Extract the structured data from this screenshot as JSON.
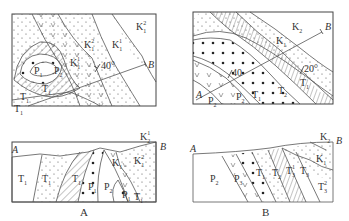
{
  "figure": {
    "panels": [
      {
        "id": "A",
        "caption": "A",
        "map": {
          "labels": [
            {
              "text": "K",
              "sub": "1",
              "sup": "2",
              "pos": "top-right"
            },
            {
              "text": "K",
              "sub": "1",
              "sup": "1",
              "pos": "center-right"
            },
            {
              "text": "K",
              "sub": "1",
              "sup": "2",
              "pos": "center"
            },
            {
              "text": "K",
              "sub": "1",
              "pos": "center-left"
            },
            {
              "text": "P",
              "sub": "1",
              "pos": "core-left"
            },
            {
              "text": "P",
              "sub": "2",
              "pos": "core"
            },
            {
              "text": "T",
              "sub": "1",
              "pos": "fold-limb"
            },
            {
              "text": "T",
              "sub": "1",
              "pos": "bottom-left"
            },
            {
              "text": "T",
              "sub": "1",
              "pos": "corner"
            }
          ],
          "dip": "40°",
          "section_line": {
            "start": "A",
            "end": "B"
          }
        },
        "section": {
          "end_left": "A",
          "end_right": "B",
          "labels": [
            {
              "text": "T",
              "sub": "1"
            },
            {
              "text": "T",
              "sub": "1"
            },
            {
              "text": "T",
              "sub": "1"
            },
            {
              "text": "P",
              "sub": "1"
            },
            {
              "text": "P",
              "sub": "2"
            },
            {
              "text": "P",
              "sub": "1"
            },
            {
              "text": "T",
              "sub": "1"
            },
            {
              "text": "K",
              "sub": "1"
            },
            {
              "text": "K",
              "sub": "1",
              "sup": "2"
            },
            {
              "text": "K",
              "sub": "2",
              "sup": "1"
            }
          ]
        }
      },
      {
        "id": "B",
        "caption": "B",
        "map": {
          "labels": [
            {
              "text": "K",
              "sub": "2"
            },
            {
              "text": "K",
              "sub": "1"
            },
            {
              "text": "T",
              "sub": "1"
            },
            {
              "text": "T",
              "sub": "2"
            },
            {
              "text": "T",
              "sub": "1"
            },
            {
              "text": "P",
              "sub": "2"
            },
            {
              "text": "P",
              "sub": "2"
            }
          ],
          "dips": [
            "40",
            "20°"
          ],
          "section_line": {
            "start": "A",
            "end": "B"
          }
        },
        "section": {
          "end_left": "A",
          "end_right": "B",
          "labels": [
            {
              "text": "P",
              "sub": "2"
            },
            {
              "text": "P",
              "sub": "3"
            },
            {
              "text": "T",
              "sub": "1"
            },
            {
              "text": "T",
              "sub": "2"
            },
            {
              "text": "T",
              "sub": "3",
              "sup": "1"
            },
            {
              "text": "T",
              "sub": "3"
            },
            {
              "text": "K",
              "sub": "1"
            },
            {
              "text": "K",
              "sub": "2"
            },
            {
              "text": "T",
              "sub": "3",
              "sup": "2"
            }
          ]
        }
      }
    ]
  }
}
